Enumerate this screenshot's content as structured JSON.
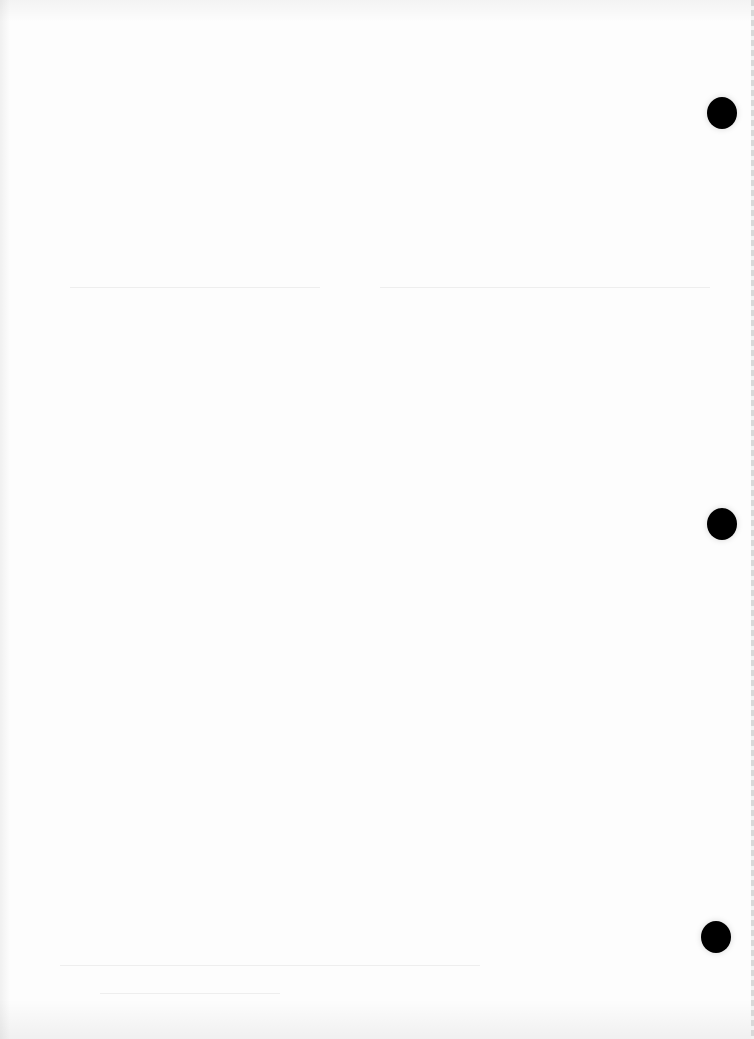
{
  "document": {
    "type": "blank scanned page",
    "text": "",
    "background_color": "#fdfdfd",
    "punch_holes": [
      {
        "x": 722,
        "y": 113
      },
      {
        "x": 722,
        "y": 524
      },
      {
        "x": 716,
        "y": 937
      }
    ],
    "hole_color": "#000000"
  }
}
